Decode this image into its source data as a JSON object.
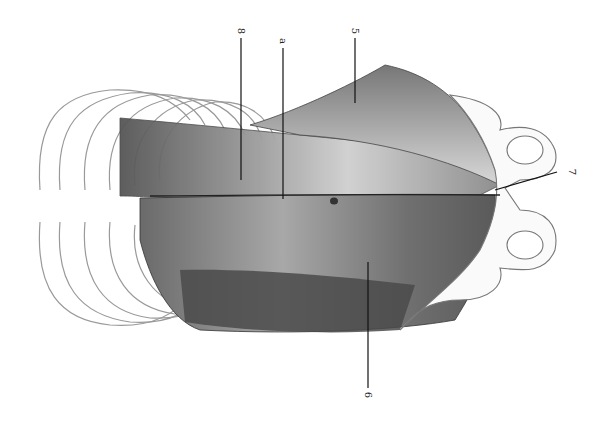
{
  "illustration": {
    "subject": "abdominal wall muscles over ribcage and pelvis (pencil drawing, rotated)",
    "labels": [
      {
        "id": "label-8",
        "text": "8"
      },
      {
        "id": "label-a",
        "text": "a"
      },
      {
        "id": "label-5",
        "text": "5"
      },
      {
        "id": "label-7",
        "text": "7"
      },
      {
        "id": "label-6",
        "text": "6"
      }
    ]
  }
}
